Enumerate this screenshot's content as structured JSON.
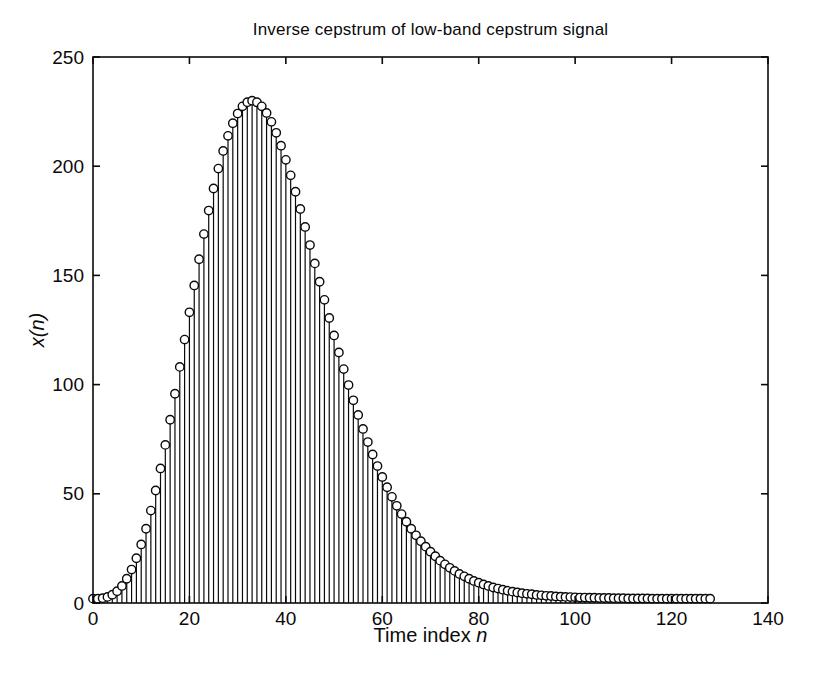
{
  "figure": {
    "title": "Inverse cepstrum of low-band cepstrum signal",
    "xlabel_prefix": "Time index ",
    "xlabel_var": "n",
    "ylabel": "x(n)"
  },
  "chart_data": {
    "type": "scatter",
    "variant": "stem",
    "title": "Inverse cepstrum of low-band cepstrum signal",
    "xlabel": "Time index n",
    "ylabel": "x(n)",
    "marker": "open-circle",
    "stroke_color": "#0a0a0a",
    "marker_fill": "#ffffff",
    "background": "#ffffff",
    "grid": false,
    "legend_position": "none",
    "xlim": [
      0,
      140
    ],
    "ylim": [
      0,
      250
    ],
    "x_ticks": [
      0,
      20,
      40,
      60,
      80,
      100,
      120,
      140
    ],
    "y_ticks": [
      0,
      50,
      100,
      150,
      200,
      250
    ],
    "x_is_index": true,
    "x_start": 0,
    "x_step": 1,
    "n_points": 129,
    "peak": {
      "n": 33,
      "value": 230
    },
    "values": [
      2.0,
      2.0,
      2.2,
      2.8,
      3.8,
      5.4,
      7.8,
      11.1,
      15.3,
      20.5,
      26.8,
      34.0,
      42.3,
      51.5,
      61.6,
      72.4,
      83.9,
      95.8,
      108.1,
      120.6,
      133.1,
      145.4,
      157.4,
      168.9,
      179.7,
      189.8,
      198.9,
      207.0,
      213.9,
      219.7,
      224.1,
      227.4,
      229.3,
      230.0,
      229.3,
      227.4,
      224.4,
      220.3,
      215.3,
      209.4,
      202.9,
      195.8,
      188.3,
      180.4,
      172.2,
      163.9,
      155.5,
      147.1,
      138.8,
      130.5,
      122.5,
      114.7,
      107.1,
      99.8,
      92.8,
      86.1,
      79.7,
      73.7,
      68.0,
      62.7,
      57.7,
      53.0,
      48.6,
      44.5,
      40.7,
      37.2,
      34.0,
      31.0,
      28.3,
      25.8,
      23.5,
      21.4,
      19.4,
      17.7,
      16.1,
      14.7,
      13.3,
      12.2,
      11.1,
      10.1,
      9.3,
      8.5,
      7.8,
      7.1,
      6.6,
      6.1,
      5.6,
      5.2,
      4.8,
      4.5,
      4.2,
      4.0,
      3.7,
      3.5,
      3.3,
      3.2,
      3.0,
      2.9,
      2.8,
      2.7,
      2.6,
      2.5,
      2.5,
      2.4,
      2.4,
      2.3,
      2.3,
      2.3,
      2.2,
      2.2,
      2.2,
      2.1,
      2.1,
      2.1,
      2.1,
      2.1,
      2.0,
      2.0,
      2.0,
      2.0,
      2.0,
      2.0,
      2.0,
      2.0,
      2.0,
      2.0,
      2.0,
      2.0,
      2.0
    ]
  }
}
